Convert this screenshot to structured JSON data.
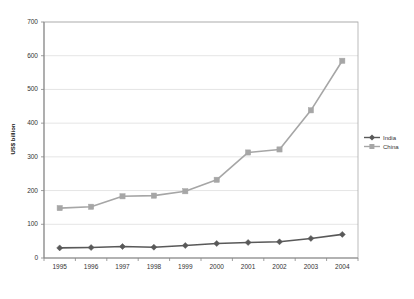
{
  "chart_data": {
    "type": "line",
    "title": "",
    "subtitle": "",
    "xlabel": "",
    "ylabel": "US$ billion",
    "categories": [
      "1995",
      "1996",
      "1997",
      "1998",
      "1999",
      "2000",
      "2001",
      "2002",
      "2003",
      "2004"
    ],
    "series": [
      {
        "name": "India",
        "marker": "diamond",
        "color": "#595959",
        "values": [
          30,
          31,
          34,
          32,
          37,
          43,
          46,
          48,
          58,
          70
        ]
      },
      {
        "name": "China",
        "marker": "square",
        "color": "#a6a6a6",
        "values": [
          148,
          152,
          183,
          185,
          198,
          232,
          313,
          322,
          438,
          585
        ]
      }
    ],
    "ylim": [
      0,
      700
    ],
    "yticks": [
      0,
      100,
      200,
      300,
      400,
      500,
      600,
      700
    ],
    "ytick_labels": [
      "0",
      "100",
      "200",
      "300",
      "400",
      "500",
      "600",
      "700"
    ],
    "grid": "horizontal",
    "legend_position": "right",
    "legend_entries": [
      "India",
      "China"
    ],
    "plot_background": "#ffffff",
    "grid_color": "#d9d9d9",
    "axis_color": "#808080"
  }
}
